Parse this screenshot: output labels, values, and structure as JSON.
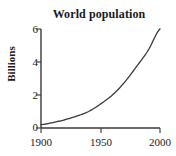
{
  "chart_data": {
    "type": "line",
    "title": "World population",
    "xlabel": "",
    "ylabel": "Billions",
    "xlim": [
      1900,
      2000
    ],
    "ylim": [
      0,
      6
    ],
    "grid": false,
    "legend": null,
    "xticks": [
      "1900",
      "1950",
      "2000"
    ],
    "xtick_values": [
      1900,
      1950,
      2000
    ],
    "yticks": [
      "0",
      "2",
      "4",
      "6"
    ],
    "ytick_values": [
      0,
      2,
      4,
      6
    ],
    "series": [
      {
        "name": "World population",
        "color": "#3a3a3a",
        "x": [
          1900,
          1910,
          1920,
          1930,
          1940,
          1950,
          1960,
          1970,
          1980,
          1990,
          2000
        ],
        "values": [
          0.2,
          0.33,
          0.5,
          0.72,
          1.0,
          1.45,
          2.0,
          2.75,
          3.7,
          4.7,
          6.0
        ]
      }
    ]
  },
  "axis": {
    "line_color": "#3a3a3a"
  }
}
